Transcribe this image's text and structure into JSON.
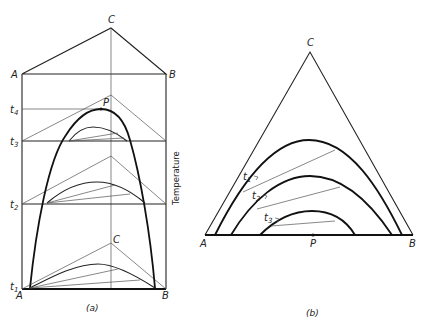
{
  "figure": {
    "panel_a": {
      "caption": "(a)",
      "vertex_labels": {
        "A_top": "A",
        "B_top": "B",
        "C_top": "C",
        "A_bottom": "A",
        "B_bottom": "B",
        "C_bottom": "C"
      },
      "point_label": "P",
      "axis_label": "Temperature",
      "levels": [
        {
          "name": "t",
          "sub": "4"
        },
        {
          "name": "t",
          "sub": "3"
        },
        {
          "name": "t",
          "sub": "2"
        },
        {
          "name": "t",
          "sub": "1"
        }
      ]
    },
    "panel_b": {
      "caption": "(b)",
      "vertex_labels": {
        "A": "A",
        "B": "B",
        "C": "C"
      },
      "point_label": "P",
      "isotherm_labels": [
        {
          "name": "t",
          "sub": "1"
        },
        {
          "name": "t",
          "sub": "2"
        },
        {
          "name": "t",
          "sub": "3"
        }
      ]
    },
    "colors": {
      "line": "#111111",
      "thin_line": "#555555",
      "background": "#ffffff"
    }
  }
}
